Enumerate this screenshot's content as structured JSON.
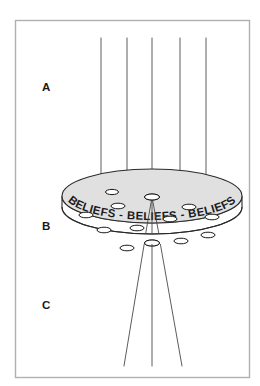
{
  "diagram": {
    "rim_text": "BELIEFS - BELIEFS - BELIEFS",
    "labels": [
      {
        "id": "A",
        "text": "A",
        "meaning": "region-above-disc"
      },
      {
        "id": "B",
        "text": "B",
        "meaning": "disc-region"
      },
      {
        "id": "C",
        "text": "C",
        "meaning": "region-below-disc"
      }
    ],
    "colors": {
      "frame_stroke": "#b0b0b0",
      "line_stroke": "#4a4a4a",
      "outline_stroke": "#2a2a2a",
      "disc_fill": "#e0e0e0",
      "rim_fill": "#ffffff",
      "hole_fill": "#ffffff",
      "text_color": "#1a1a1a",
      "background": "#ffffff"
    },
    "frame": {
      "x": 15,
      "y": 20,
      "width": 235,
      "height": 358
    },
    "disc": {
      "center_x": 152,
      "top_ellipse_cy": 196,
      "bottom_ellipse_cy": 207,
      "rx": 90,
      "ry": 27,
      "shape": "elliptical-disc-with-rim"
    },
    "upper_rays": {
      "count": 5,
      "description": "vertical parallel lines descending into the disc",
      "x_positions": [
        101,
        127,
        152,
        180,
        206
      ],
      "y_top": 38,
      "y_bottom": 186
    },
    "lower_rays": {
      "count": 3,
      "description": "lines diverging downward from the convergence hole",
      "origin_x": 152,
      "origin_y": 197,
      "end_y": 366,
      "end_x_positions": [
        124,
        152,
        182
      ]
    },
    "holes": {
      "count": 13,
      "description": "small elliptical perforations on the disc face",
      "items": [
        {
          "cx": 152,
          "cy": 197,
          "rx": 7.5,
          "ry": 3.0,
          "role": "convergence-hole"
        },
        {
          "cx": 152,
          "cy": 243,
          "rx": 7.5,
          "ry": 3.0,
          "role": "lower-center-hole"
        },
        {
          "cx": 118,
          "cy": 206,
          "rx": 7.0,
          "ry": 2.8,
          "role": "hole"
        },
        {
          "cx": 86,
          "cy": 215,
          "rx": 7.0,
          "ry": 2.8,
          "role": "hole"
        },
        {
          "cx": 104,
          "cy": 230,
          "rx": 7.0,
          "ry": 2.8,
          "role": "hole"
        },
        {
          "cx": 137,
          "cy": 228,
          "rx": 7.0,
          "ry": 2.8,
          "role": "hole"
        },
        {
          "cx": 127,
          "cy": 248,
          "rx": 7.0,
          "ry": 2.8,
          "role": "hole"
        },
        {
          "cx": 170,
          "cy": 219,
          "rx": 7.0,
          "ry": 2.8,
          "role": "hole"
        },
        {
          "cx": 189,
          "cy": 207,
          "rx": 7.0,
          "ry": 2.8,
          "role": "hole"
        },
        {
          "cx": 212,
          "cy": 217,
          "rx": 7.0,
          "ry": 2.8,
          "role": "hole"
        },
        {
          "cx": 208,
          "cy": 235,
          "rx": 7.0,
          "ry": 2.8,
          "role": "hole"
        },
        {
          "cx": 181,
          "cy": 241,
          "rx": 7.0,
          "ry": 2.8,
          "role": "hole"
        },
        {
          "cx": 112,
          "cy": 192,
          "rx": 6.5,
          "ry": 2.6,
          "role": "hole"
        }
      ]
    }
  }
}
